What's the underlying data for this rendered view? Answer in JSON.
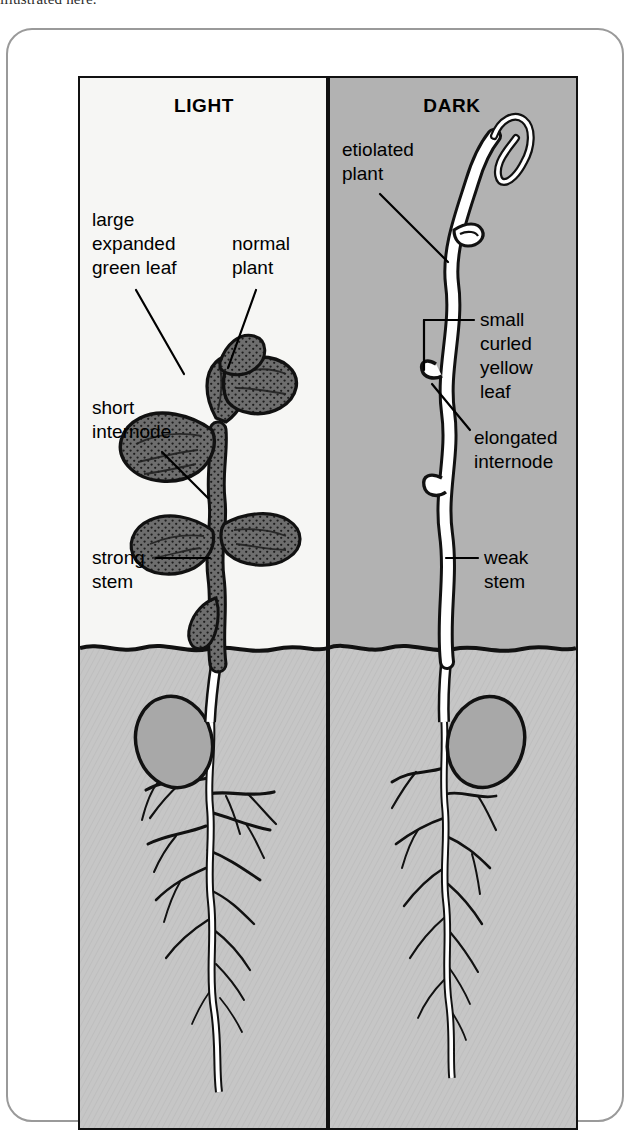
{
  "clipped_text_top": "illustrated here.",
  "figure": {
    "panels": [
      {
        "id": "light",
        "title": "LIGHT",
        "background_color": "#f6f6f4",
        "plant_type": "normal de-etiolated seedling",
        "labels": [
          {
            "id": "large-expanded-green-leaf",
            "lines": [
              "large",
              "expanded",
              "green leaf"
            ]
          },
          {
            "id": "normal-plant",
            "lines": [
              "normal",
              "plant"
            ]
          },
          {
            "id": "short-internode",
            "lines": [
              "short",
              "internode"
            ]
          },
          {
            "id": "strong-stem",
            "lines": [
              "strong",
              "stem"
            ]
          }
        ]
      },
      {
        "id": "dark",
        "title": "DARK",
        "background_color": "#b2b2b2",
        "plant_type": "etiolated seedling",
        "labels": [
          {
            "id": "etiolated-plant",
            "lines": [
              "etiolated",
              "plant"
            ]
          },
          {
            "id": "small-curled-yellow-leaf",
            "lines": [
              "small",
              "curled",
              "yellow",
              "leaf"
            ]
          },
          {
            "id": "elongated-internode",
            "lines": [
              "elongated",
              "internode"
            ]
          },
          {
            "id": "weak-stem",
            "lines": [
              "weak",
              "stem"
            ]
          }
        ]
      }
    ],
    "soil": {
      "color": "#c6c6c6",
      "seed_color": "#a8a8a8",
      "description": "shared soil band with seed cotyledon and branching root system under each plant"
    },
    "colors": {
      "outline": "#111111",
      "frame": "#9a9a9a",
      "light_panel": "#f6f6f4",
      "dark_panel": "#b2b2b2",
      "soil": "#c6c6c6",
      "seed": "#a8a8a8",
      "green_leaf_fill": "#6e6e6e",
      "pale_stem_fill": "#ffffff"
    }
  }
}
